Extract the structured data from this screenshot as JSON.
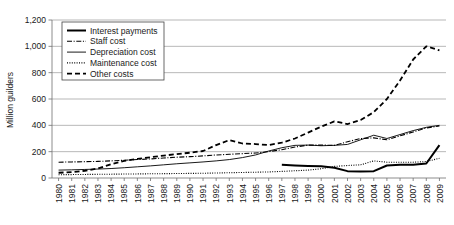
{
  "chart_data": {
    "type": "line",
    "title": "",
    "xlabel": "",
    "ylabel": "Million guilders",
    "ylim": [
      0,
      1200
    ],
    "yticks": [
      0,
      200,
      400,
      600,
      800,
      1000,
      1200
    ],
    "ytick_labels": [
      "0",
      "200",
      "400",
      "600",
      "800",
      "1,000",
      "1,200"
    ],
    "grid": true,
    "legend_position": "top-left",
    "x": [
      1980,
      1981,
      1982,
      1983,
      1984,
      1985,
      1986,
      1987,
      1988,
      1989,
      1990,
      1991,
      1992,
      1993,
      1994,
      1995,
      1996,
      1997,
      1998,
      1999,
      2000,
      2001,
      2002,
      2003,
      2004,
      2005,
      2006,
      2007,
      2008,
      2009
    ],
    "xtick_labels": [
      "1980",
      "1981",
      "1982",
      "1983",
      "1984",
      "1985",
      "1986",
      "1987",
      "1988",
      "1989",
      "1990",
      "1991",
      "1992",
      "1993",
      "1994",
      "1995",
      "1996",
      "1997",
      "1998",
      "1999",
      "2000",
      "2001",
      "2002",
      "2003",
      "2004",
      "2005",
      "2006",
      "2007",
      "2008",
      "2009"
    ],
    "series": [
      {
        "name": "Interest payments",
        "style": "solid-bold",
        "values": [
          null,
          null,
          null,
          null,
          null,
          null,
          null,
          null,
          null,
          null,
          null,
          null,
          null,
          null,
          null,
          null,
          null,
          100,
          95,
          92,
          90,
          78,
          52,
          50,
          52,
          95,
          100,
          100,
          110,
          250
        ]
      },
      {
        "name": "Staff cost",
        "style": "dash-dot",
        "values": [
          120,
          122,
          124,
          126,
          130,
          135,
          140,
          145,
          152,
          158,
          162,
          168,
          175,
          180,
          185,
          190,
          200,
          215,
          235,
          250,
          250,
          248,
          275,
          300,
          305,
          290,
          320,
          350,
          380,
          395
        ]
      },
      {
        "name": "Depreciation cost",
        "style": "solid-thin",
        "values": [
          60,
          62,
          65,
          68,
          72,
          78,
          85,
          92,
          100,
          108,
          115,
          122,
          130,
          140,
          155,
          175,
          205,
          230,
          248,
          250,
          245,
          248,
          255,
          290,
          325,
          300,
          330,
          360,
          385,
          400
        ]
      },
      {
        "name": "Maintenance cost",
        "style": "dotted",
        "values": [
          25,
          26,
          27,
          28,
          29,
          30,
          31,
          32,
          33,
          34,
          35,
          36,
          38,
          40,
          42,
          44,
          46,
          50,
          55,
          60,
          70,
          88,
          95,
          100,
          130,
          120,
          120,
          120,
          125,
          150
        ]
      },
      {
        "name": "Other costs",
        "style": "dashed",
        "values": [
          40,
          45,
          55,
          72,
          105,
          130,
          145,
          158,
          170,
          182,
          192,
          205,
          250,
          288,
          262,
          258,
          250,
          268,
          300,
          345,
          390,
          430,
          410,
          440,
          500,
          600,
          740,
          900,
          1000,
          970
        ]
      }
    ]
  },
  "legend": {
    "items": [
      {
        "label": "Interest payments"
      },
      {
        "label": "Staff cost"
      },
      {
        "label": "Depreciation cost"
      },
      {
        "label": "Maintenance cost"
      },
      {
        "label": "Other costs"
      }
    ]
  }
}
